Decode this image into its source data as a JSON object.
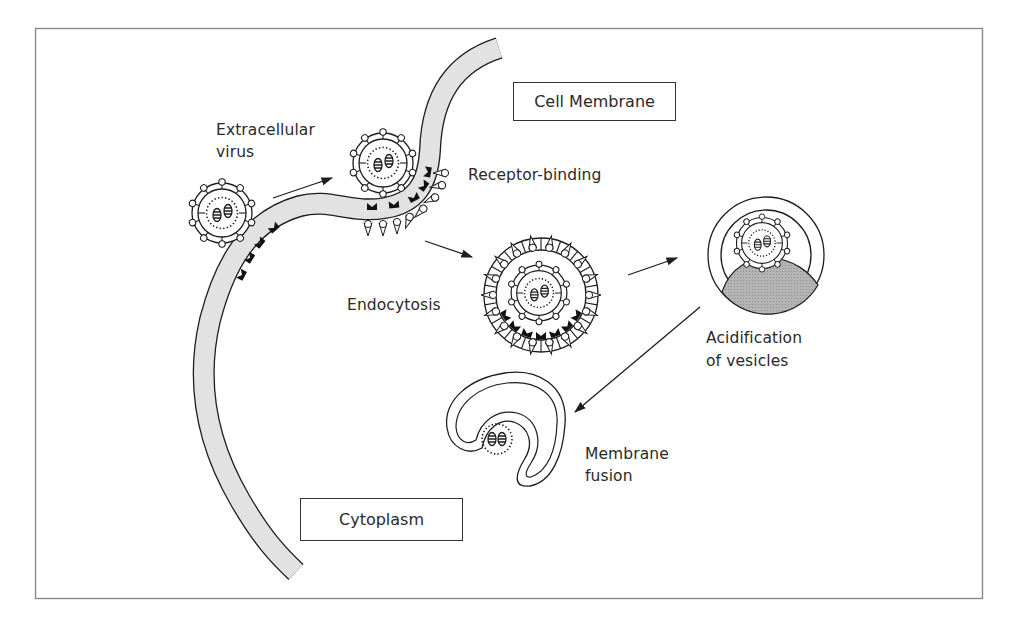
{
  "diagram": {
    "title_labels": {
      "cell_membrane": "Cell Membrane",
      "cytoplasm": "Cytoplasm"
    },
    "step_labels": {
      "extracellular_virus_line1": "Extracellular",
      "extracellular_virus_line2": "virus",
      "receptor_binding": "Receptor-binding",
      "endocytosis": "Endocytosis",
      "acidification_line1": "Acidification",
      "acidification_line2": "of vesicles",
      "membrane_fusion_line1": "Membrane",
      "membrane_fusion_line2": "fusion"
    },
    "colors": {
      "frame": "#8a8a8a",
      "membrane_fill": "#e2e2e2",
      "stroke": "#1e1e1e",
      "acid_fill": "#a9a9a9",
      "receptor": "#111111"
    },
    "stages": [
      "Extracellular virus",
      "Receptor-binding",
      "Endocytosis",
      "Acidification of vesicles",
      "Membrane fusion"
    ]
  }
}
